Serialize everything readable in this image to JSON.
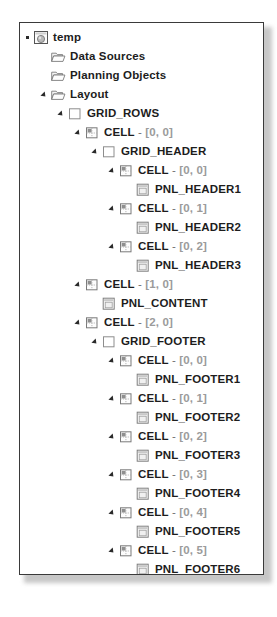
{
  "panel": {
    "name": "object-tree-panel",
    "background": "#ffffff",
    "border_color": "#3a3a3a"
  },
  "colors": {
    "label": "#1d1d1d",
    "coordinate": "#9b9b9b",
    "separator": "#6e6e6e",
    "folder_outline": "#6f6f6f",
    "icon_outline": "#7a7a7a"
  },
  "tree": {
    "nodes": [
      {
        "label": "temp",
        "coord": "",
        "level": 0,
        "icon": "sphere-object-icon",
        "twisty": "dot"
      },
      {
        "label": "Data Sources",
        "coord": "",
        "level": 1,
        "icon": "open-folder-icon",
        "twisty": "none"
      },
      {
        "label": "Planning Objects",
        "coord": "",
        "level": 1,
        "icon": "open-folder-icon",
        "twisty": "none"
      },
      {
        "label": "Layout",
        "coord": "",
        "level": 1,
        "icon": "open-folder-icon",
        "twisty": "expanded"
      },
      {
        "label": "GRID_ROWS",
        "coord": "",
        "level": 2,
        "icon": "grid-square-icon",
        "twisty": "expanded"
      },
      {
        "label": "CELL",
        "coord": "[0, 0]",
        "level": 3,
        "icon": "cell-icon",
        "twisty": "expanded"
      },
      {
        "label": "GRID_HEADER",
        "coord": "",
        "level": 4,
        "icon": "grid-square-icon",
        "twisty": "expanded"
      },
      {
        "label": "CELL",
        "coord": "[0, 0]",
        "level": 5,
        "icon": "cell-icon",
        "twisty": "expanded"
      },
      {
        "label": "PNL_HEADER1",
        "coord": "",
        "level": 6,
        "icon": "panel-window-icon",
        "twisty": "none"
      },
      {
        "label": "CELL",
        "coord": "[0, 1]",
        "level": 5,
        "icon": "cell-icon",
        "twisty": "expanded"
      },
      {
        "label": "PNL_HEADER2",
        "coord": "",
        "level": 6,
        "icon": "panel-window-icon",
        "twisty": "none"
      },
      {
        "label": "CELL",
        "coord": "[0, 2]",
        "level": 5,
        "icon": "cell-icon",
        "twisty": "expanded"
      },
      {
        "label": "PNL_HEADER3",
        "coord": "",
        "level": 6,
        "icon": "panel-window-icon",
        "twisty": "none"
      },
      {
        "label": "CELL",
        "coord": "[1, 0]",
        "level": 3,
        "icon": "cell-icon",
        "twisty": "expanded"
      },
      {
        "label": "PNL_CONTENT",
        "coord": "",
        "level": 4,
        "icon": "panel-window-icon",
        "twisty": "none"
      },
      {
        "label": "CELL",
        "coord": "[2, 0]",
        "level": 3,
        "icon": "cell-icon",
        "twisty": "expanded"
      },
      {
        "label": "GRID_FOOTER",
        "coord": "",
        "level": 4,
        "icon": "grid-square-icon",
        "twisty": "expanded"
      },
      {
        "label": "CELL",
        "coord": "[0, 0]",
        "level": 5,
        "icon": "cell-icon",
        "twisty": "expanded"
      },
      {
        "label": "PNL_FOOTER1",
        "coord": "",
        "level": 6,
        "icon": "panel-window-icon",
        "twisty": "none"
      },
      {
        "label": "CELL",
        "coord": "[0, 1]",
        "level": 5,
        "icon": "cell-icon",
        "twisty": "expanded"
      },
      {
        "label": "PNL_FOOTER2",
        "coord": "",
        "level": 6,
        "icon": "panel-window-icon",
        "twisty": "none"
      },
      {
        "label": "CELL",
        "coord": "[0, 2]",
        "level": 5,
        "icon": "cell-icon",
        "twisty": "expanded"
      },
      {
        "label": "PNL_FOOTER3",
        "coord": "",
        "level": 6,
        "icon": "panel-window-icon",
        "twisty": "none"
      },
      {
        "label": "CELL",
        "coord": "[0, 3]",
        "level": 5,
        "icon": "cell-icon",
        "twisty": "expanded"
      },
      {
        "label": "PNL_FOOTER4",
        "coord": "",
        "level": 6,
        "icon": "panel-window-icon",
        "twisty": "none"
      },
      {
        "label": "CELL",
        "coord": "[0, 4]",
        "level": 5,
        "icon": "cell-icon",
        "twisty": "expanded"
      },
      {
        "label": "PNL_FOOTER5",
        "coord": "",
        "level": 6,
        "icon": "panel-window-icon",
        "twisty": "none"
      },
      {
        "label": "CELL",
        "coord": "[0, 5]",
        "level": 5,
        "icon": "cell-icon",
        "twisty": "expanded"
      },
      {
        "label": "PNL_FOOTER6",
        "coord": "",
        "level": 6,
        "icon": "panel-window-icon",
        "twisty": "none"
      }
    ]
  }
}
